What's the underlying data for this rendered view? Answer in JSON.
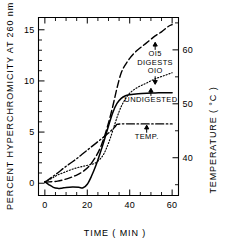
{
  "chart_data": {
    "type": "line",
    "title": "",
    "xlabel": "TIME  ( MIN )",
    "ylabel": "PERCENT  HYPERCHROMICITY  AT  260 nm",
    "y2label": "TEMPERATURE  ( °C )",
    "xlim": [
      -3,
      63
    ],
    "ylim": [
      -1.2,
      16.2
    ],
    "y2lim": [
      33.0,
      66.0
    ],
    "xticks": [
      0,
      20,
      40,
      60
    ],
    "xtick_labels": [
      "0",
      "20",
      "40",
      "60"
    ],
    "xticks_minor": [
      5,
      10,
      15,
      25,
      30,
      35,
      45,
      50,
      55
    ],
    "yticks": [
      0,
      5,
      10,
      15
    ],
    "ytick_labels": [
      "0",
      "5",
      "10",
      "15"
    ],
    "yticks_minor": [
      1,
      2,
      3,
      4,
      6,
      7,
      8,
      9,
      11,
      12,
      13,
      14
    ],
    "y2ticks": [
      40,
      50,
      60
    ],
    "y2tick_labels": [
      "40",
      "50",
      "60"
    ],
    "y2ticks_minor": [
      35,
      45,
      55,
      65
    ],
    "grid": false,
    "legend_position": "inline-annotations",
    "series": [
      {
        "name": "O15 DIGESTS O10",
        "style": "dashed",
        "axis": "left",
        "x": [
          0,
          3,
          6,
          9,
          12,
          15,
          18,
          21,
          24,
          26,
          28,
          30,
          32,
          34,
          36,
          38,
          40,
          43,
          46,
          49,
          52,
          55,
          58,
          60
        ],
        "values": [
          0.1,
          0.15,
          0.2,
          0.35,
          0.55,
          0.8,
          1.15,
          1.7,
          2.6,
          3.4,
          4.5,
          5.9,
          7.5,
          9.3,
          10.8,
          11.6,
          12.2,
          12.9,
          13.4,
          13.9,
          14.4,
          14.8,
          15.3,
          15.5
        ]
      },
      {
        "name": "unlabeled dotted curve",
        "style": "dotted",
        "axis": "left",
        "x": [
          0,
          3,
          6,
          9,
          12,
          15,
          18,
          21,
          24,
          27,
          29,
          31,
          33,
          35,
          37,
          40,
          44,
          48,
          52,
          56,
          60
        ],
        "values": [
          0.15,
          0.45,
          0.8,
          1.05,
          1.3,
          1.5,
          1.65,
          1.8,
          2.0,
          2.6,
          3.4,
          4.5,
          5.8,
          7.0,
          7.9,
          8.8,
          9.4,
          9.8,
          10.2,
          10.5,
          10.8
        ]
      },
      {
        "name": "UNDIGESTED",
        "style": "solid",
        "axis": "left",
        "x": [
          0,
          2,
          4,
          6,
          8,
          10,
          13,
          16,
          18,
          20,
          22,
          24,
          26,
          28,
          30,
          32,
          34,
          36,
          38,
          40,
          44,
          48,
          52,
          56,
          60
        ],
        "values": [
          0.15,
          -0.15,
          -0.4,
          -0.5,
          -0.48,
          -0.42,
          -0.38,
          -0.4,
          -0.45,
          -0.1,
          0.7,
          1.7,
          2.9,
          4.2,
          5.6,
          6.9,
          7.8,
          8.3,
          8.55,
          8.65,
          8.75,
          8.8,
          8.82,
          8.85,
          8.85
        ]
      },
      {
        "name": "TEMP.",
        "style": "dash-dot",
        "axis": "left-scaled-temperature",
        "x": [
          0,
          3,
          6,
          9,
          12,
          15,
          18,
          21,
          24,
          27,
          30,
          33,
          34,
          36,
          40,
          45,
          50,
          55,
          60
        ],
        "values": [
          0.1,
          0.55,
          1.0,
          1.5,
          1.95,
          2.4,
          2.9,
          3.4,
          3.9,
          4.4,
          4.9,
          5.5,
          5.75,
          5.8,
          5.8,
          5.8,
          5.8,
          5.8,
          5.8
        ],
        "temperature_values": [
          33.5,
          34.5,
          35.4,
          36.4,
          37.2,
          38.1,
          39.1,
          40.1,
          41.0,
          42.0,
          42.9,
          44.1,
          44.5,
          44.6,
          44.6,
          44.6,
          44.6,
          44.6,
          44.6
        ],
        "plateau_temperature_c": 63
      }
    ],
    "annotations": [
      {
        "name": "o15-digests-o10",
        "lines": [
          "OI5",
          "DIGESTS",
          "OIO"
        ],
        "x": 52,
        "y": 12.4
      },
      {
        "name": "undigested",
        "lines": [
          "UNDIGESTED"
        ],
        "x": 50,
        "y": 7.9
      },
      {
        "name": "temp",
        "lines": [
          "TEMP."
        ],
        "x": 48,
        "y": 4.3
      }
    ]
  },
  "axes": {
    "left_title": "PERCENT  HYPERCHROMICITY  AT  260 nm",
    "bottom_title": "TIME  ( MIN )",
    "right_title": "TEMPERATURE  ( °C )"
  },
  "colors": {
    "ink": "#000000",
    "background": "#ffffff"
  }
}
